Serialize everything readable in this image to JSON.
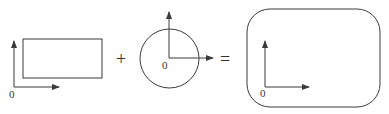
{
  "diagram": {
    "colors": {
      "stroke": "#3a3a3a",
      "text": "#333333",
      "background": "#ffffff"
    },
    "panels": [
      {
        "shape": "rectangle",
        "origin_label": "0"
      },
      {
        "shape": "circle",
        "origin_label": "0"
      },
      {
        "shape": "rounded-rectangle",
        "origin_label": "0"
      }
    ],
    "operators": {
      "plus": "+",
      "equals": "="
    }
  }
}
